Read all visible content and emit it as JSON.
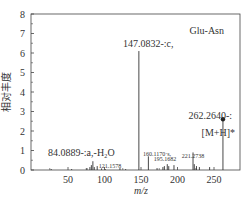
{
  "chart_data": {
    "type": "bar",
    "subtype": "mass-spectrum-stick",
    "title": "Glu-Asn",
    "xlabel": "m/z",
    "ylabel": "相对丰度",
    "xlim": [
      0,
      285
    ],
    "ylim": [
      0,
      8
    ],
    "xticks": [
      50,
      100,
      150,
      200,
      250
    ],
    "yticks": [
      0,
      1,
      2,
      3,
      4,
      5,
      6,
      7,
      8
    ],
    "grid": false,
    "legend": null,
    "x": [
      27,
      55,
      76,
      80,
      82,
      84.0889,
      86,
      90,
      96,
      101,
      121.1578,
      129,
      147.0832,
      160.117,
      172,
      180,
      182,
      186,
      188,
      195.1682,
      221.2738,
      223,
      226,
      230,
      244,
      262.264
    ],
    "values": [
      0.05,
      0.05,
      0.1,
      0.15,
      0.25,
      0.45,
      0.15,
      0.2,
      0.08,
      0.05,
      0.1,
      0.05,
      6.1,
      0.7,
      0.1,
      0.15,
      0.2,
      0.3,
      0.2,
      0.25,
      0.9,
      0.3,
      0.2,
      0.15,
      0.15,
      2.6
    ],
    "annotations": [
      {
        "text": "147.0832-:c,",
        "x": 147.0832,
        "y": 6.1
      },
      {
        "text": "262.2640-:",
        "x": 262.264,
        "y": 4.0
      },
      {
        "text": "[M+H]*",
        "x": 262.264,
        "y": 3.3
      },
      {
        "text": "84.0889-:a,-H₂O",
        "x": 84.0889,
        "y": 1.0
      },
      {
        "text": "121.1578",
        "x": 121.1578,
        "y": 0.4
      },
      {
        "text": "160.1170·s,",
        "x": 160.117,
        "y": 1.2
      },
      {
        "text": "195.1682",
        "x": 195.1682,
        "y": 0.75
      },
      {
        "text": "221.2738",
        "x": 221.2738,
        "y": 1.05
      }
    ],
    "marker": {
      "x": 262.264,
      "y": 2.6,
      "shape": "filled-circle"
    }
  }
}
